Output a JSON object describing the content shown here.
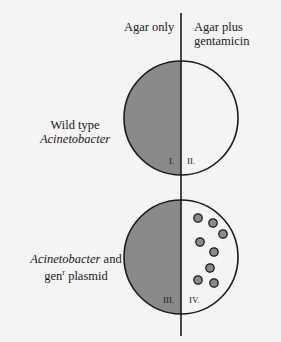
{
  "header": {
    "left_column": "Agar only",
    "right_column_line1": "Agar plus",
    "right_column_line2": "gentamicin"
  },
  "rows": [
    {
      "label_line1": "Wild type",
      "label_line2": "Acinetobacter",
      "left_quadrant": "I.",
      "right_quadrant": "II."
    },
    {
      "label_line1_italic": "Acinetobacter",
      "label_line1_rest": " and",
      "label_line2_base": "gen",
      "label_line2_sup": "r",
      "label_line2_rest": " plasmid",
      "left_quadrant": "III.",
      "right_quadrant": "IV."
    }
  ],
  "colors": {
    "growth_fill": "#8a8a8a",
    "colony_fill": "#8a8a8a",
    "outline": "#1a1a1a",
    "background": "#f4f4f4"
  }
}
